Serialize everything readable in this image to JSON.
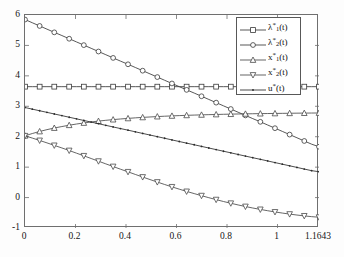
{
  "chart_data": {
    "type": "line",
    "title": "",
    "xlabel": "",
    "ylabel": "",
    "xlim": [
      0,
      1.1643
    ],
    "ylim": [
      -1,
      6
    ],
    "grid": false,
    "legend_position": "upper-right",
    "xticks": [
      "0",
      "0.2",
      "0.4",
      "0.6",
      "0.8",
      "1",
      "1.1643"
    ],
    "xtick_values": [
      0,
      0.2,
      0.4,
      0.6,
      0.8,
      1,
      1.1643
    ],
    "yticks": [
      "-1",
      "0",
      "1",
      "2",
      "3",
      "4",
      "5",
      "6"
    ],
    "ytick_values": [
      -1,
      0,
      1,
      2,
      3,
      4,
      5,
      6
    ],
    "x": [
      0,
      0.029,
      0.058,
      0.087,
      0.116,
      0.146,
      0.175,
      0.204,
      0.233,
      0.262,
      0.291,
      0.32,
      0.349,
      0.378,
      0.408,
      0.437,
      0.466,
      0.495,
      0.524,
      0.553,
      0.582,
      0.611,
      0.64,
      0.67,
      0.699,
      0.728,
      0.757,
      0.786,
      0.815,
      0.844,
      0.873,
      0.902,
      0.932,
      0.961,
      0.99,
      1.019,
      1.048,
      1.077,
      1.106,
      1.135,
      1.1643
    ],
    "series": [
      {
        "name": "lambda1",
        "label": "λ₁*(t)",
        "marker": "square",
        "color": "#3a3a3a",
        "values": [
          3.645,
          3.645,
          3.645,
          3.645,
          3.645,
          3.645,
          3.645,
          3.645,
          3.645,
          3.645,
          3.645,
          3.645,
          3.645,
          3.645,
          3.645,
          3.645,
          3.645,
          3.645,
          3.645,
          3.645,
          3.645,
          3.645,
          3.645,
          3.645,
          3.645,
          3.645,
          3.645,
          3.645,
          3.645,
          3.645,
          3.645,
          3.645,
          3.645,
          3.645,
          3.645,
          3.645,
          3.645,
          3.645,
          3.645,
          3.645,
          3.645
        ]
      },
      {
        "name": "lambda2",
        "label": "λ₂*(t)",
        "marker": "circle",
        "color": "#3a3a3a",
        "values": [
          5.85,
          5.745,
          5.64,
          5.535,
          5.43,
          5.325,
          5.22,
          5.115,
          5.01,
          4.905,
          4.8,
          4.695,
          4.59,
          4.485,
          4.38,
          4.275,
          4.17,
          4.065,
          3.96,
          3.855,
          3.75,
          3.645,
          3.54,
          3.435,
          3.33,
          3.225,
          3.12,
          3.015,
          2.91,
          2.805,
          2.7,
          2.595,
          2.49,
          2.385,
          2.28,
          2.175,
          2.07,
          1.965,
          1.86,
          1.755,
          1.67
        ]
      },
      {
        "name": "x1",
        "label": "x₁*(t)",
        "marker": "triangle-up",
        "color": "#4a4a4a",
        "values": [
          2.03,
          2.105,
          2.172,
          2.232,
          2.286,
          2.334,
          2.378,
          2.417,
          2.452,
          2.484,
          2.513,
          2.539,
          2.562,
          2.583,
          2.602,
          2.62,
          2.635,
          2.649,
          2.662,
          2.674,
          2.684,
          2.694,
          2.703,
          2.711,
          2.718,
          2.725,
          2.731,
          2.737,
          2.742,
          2.747,
          2.751,
          2.755,
          2.759,
          2.762,
          2.765,
          2.768,
          2.771,
          2.774,
          2.776,
          2.778,
          2.78
        ]
      },
      {
        "name": "x2",
        "label": "x₂*(t)",
        "marker": "triangle-down",
        "color": "#4a4a4a",
        "values": [
          2.03,
          1.955,
          1.877,
          1.797,
          1.715,
          1.631,
          1.546,
          1.459,
          1.372,
          1.284,
          1.196,
          1.108,
          1.02,
          0.933,
          0.846,
          0.76,
          0.675,
          0.592,
          0.51,
          0.43,
          0.352,
          0.276,
          0.202,
          0.131,
          0.062,
          -0.004,
          -0.068,
          -0.129,
          -0.187,
          -0.242,
          -0.294,
          -0.343,
          -0.389,
          -0.432,
          -0.472,
          -0.509,
          -0.543,
          -0.574,
          -0.602,
          -0.627,
          -0.646
        ]
      },
      {
        "name": "u",
        "label": "u*(t)",
        "marker": "dot",
        "color": "#2a2a2a",
        "values": [
          2.96,
          2.906,
          2.853,
          2.8,
          2.747,
          2.694,
          2.64,
          2.587,
          2.534,
          2.481,
          2.428,
          2.374,
          2.321,
          2.268,
          2.215,
          2.161,
          2.108,
          2.055,
          2.002,
          1.949,
          1.895,
          1.842,
          1.789,
          1.736,
          1.682,
          1.629,
          1.576,
          1.523,
          1.47,
          1.416,
          1.363,
          1.31,
          1.257,
          1.204,
          1.15,
          1.097,
          1.044,
          0.991,
          0.937,
          0.884,
          0.85
        ]
      }
    ]
  },
  "legend": {
    "entries": [
      {
        "label": "λ",
        "sub": "1",
        "sup": "*",
        "suffix": "(t)",
        "marker": "square"
      },
      {
        "label": "λ",
        "sub": "2",
        "sup": "*",
        "suffix": "(t)",
        "marker": "circle"
      },
      {
        "label": "x",
        "sub": "1",
        "sup": "*",
        "suffix": "(t)",
        "marker": "triangle-up"
      },
      {
        "label": "x",
        "sub": "2",
        "sup": "*",
        "suffix": "(t)",
        "marker": "triangle-down"
      },
      {
        "label": "u",
        "sub": "",
        "sup": "*",
        "suffix": "(t)",
        "marker": "dot"
      }
    ]
  }
}
